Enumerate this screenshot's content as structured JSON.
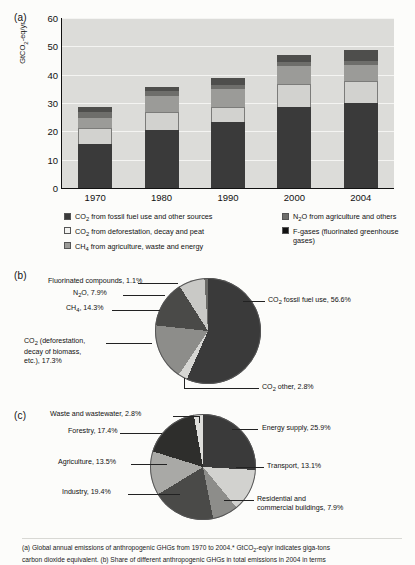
{
  "panels": {
    "a": {
      "letter": "(a)",
      "ylabel_pre": "GtCO",
      "ylabel_sub": "2",
      "ylabel_post": "-eq/yr"
    },
    "b": {
      "letter": "(b)"
    },
    "c": {
      "letter": "(c)"
    }
  },
  "legend_a": [
    {
      "key": "fossil",
      "pre": "CO",
      "sub": "2",
      "post": " from fossil fuel use and other sources",
      "color": "#3a3a3a"
    },
    {
      "key": "defor",
      "pre": "CO",
      "sub": "2",
      "post": " from deforestation, decay and peat",
      "color": "#f2f2f0"
    },
    {
      "key": "ch4",
      "pre": "CH",
      "sub": "4",
      "post": " from agriculture, waste and energy",
      "color": "#9b9b98"
    },
    {
      "key": "n2o",
      "pre": "N",
      "sub": "2",
      "post": "O from agriculture and others",
      "color": "#6e6e6b"
    },
    {
      "key": "fgases",
      "pre": "F-gases (fluorinated greenhouse",
      "sub": "",
      "post": " gases)",
      "color": "#111111"
    }
  ],
  "legend_a_labels": {
    "fossil": "CO2 from fossil fuel use and other sources",
    "defor": "CO2 from deforestation, decay and peat",
    "ch4": "CH4 from agriculture, waste and energy",
    "n2o": "N2O from agriculture and others",
    "fgases_line1": "F-gases (fluorinated greenhouse",
    "fgases_line2": "gases)"
  },
  "chart_data": [
    {
      "id": "panel-a",
      "type": "bar",
      "stacked": true,
      "title": "",
      "xlabel": "",
      "ylabel": "GtCO2-eq/yr",
      "ylim": [
        0,
        60
      ],
      "yticks": [
        0,
        10,
        20,
        30,
        40,
        50,
        60
      ],
      "grid": true,
      "categories": [
        "1970",
        "1980",
        "1990",
        "2000",
        "2004"
      ],
      "series": [
        {
          "name": "CO2 from fossil fuel use and other sources",
          "color": "#3a3a3a",
          "values": [
            15.5,
            20.3,
            23.3,
            28.5,
            30.0
          ]
        },
        {
          "name": "CO2 from deforestation, decay and peat",
          "color": "#d2d2cf",
          "values": [
            5.8,
            6.4,
            5.4,
            8.2,
            7.6
          ]
        },
        {
          "name": "CH4 from agriculture, waste and energy",
          "color": "#9b9b98",
          "values": [
            3.4,
            5.7,
            6.2,
            6.2,
            5.7
          ]
        },
        {
          "name": "N2O from agriculture and others",
          "color": "#6e6e6b",
          "values": [
            2.1,
            1.7,
            1.3,
            1.5,
            1.7
          ]
        },
        {
          "name": "F-gases (fluorinated greenhouse gases)",
          "color": "#4e4e4c",
          "values": [
            1.7,
            1.6,
            2.8,
            2.6,
            3.8
          ]
        }
      ],
      "totals": [
        28.7,
        35.6,
        39.4,
        49.0,
        49.0
      ]
    },
    {
      "id": "panel-b",
      "type": "pie",
      "title": "",
      "labels": [
        "CO2 fossil fuel use",
        "CO2 other",
        "CO2 (deforestation, decay of biomass, etc.)",
        "CH4",
        "N2O",
        "Fluorinated compounds"
      ],
      "values": [
        56.6,
        2.8,
        17.3,
        14.3,
        7.9,
        1.1
      ],
      "colors": [
        "#3a3a3a",
        "#d7d7d4",
        "#8d8d8a",
        "#4a4a48",
        "#c9c9c6",
        "#6b6b68"
      ]
    },
    {
      "id": "panel-c",
      "type": "pie",
      "title": "",
      "labels": [
        "Energy supply",
        "Transport",
        "Residential and commercial buildings",
        "Industry",
        "Agriculture",
        "Forestry",
        "Waste and wastewater"
      ],
      "values": [
        25.9,
        13.1,
        7.9,
        19.4,
        13.5,
        17.4,
        2.8
      ],
      "colors": [
        "#3a3a3a",
        "#d2d2cf",
        "#8d8d8a",
        "#4a4a48",
        "#a9a9a6",
        "#2e2e2c",
        "#dededb"
      ]
    }
  ],
  "xticks_a": [
    "1970",
    "1980",
    "1990",
    "2000",
    "2004"
  ],
  "yticks_a": [
    "60",
    "50",
    "40",
    "30",
    "20",
    "10",
    "0"
  ],
  "labels_b": {
    "fluorinated": "Fluorinated compounds, 1.1%",
    "n2o_pre": "N",
    "n2o_sub": "2",
    "n2o_post": "O, 7.9%",
    "ch4_pre": "CH",
    "ch4_sub": "4",
    "ch4_post": ", 14.3%",
    "co2_def_l1_pre": "CO",
    "co2_def_l1_sub": "2",
    "co2_def_l1_post": " (deforestation,",
    "co2_def_l2": "decay of biomass,",
    "co2_def_l3": "etc.), 17.3%",
    "co2_fossil_pre": "CO",
    "co2_fossil_sub": "2",
    "co2_fossil_post": " fossil fuel use, 56.6%",
    "co2_other_pre": "CO",
    "co2_other_sub": "2",
    "co2_other_post": " other, 2.8%"
  },
  "labels_c": {
    "waste": "Waste and wastewater, 2.8%",
    "forestry": "Forestry, 17.4%",
    "agriculture": "Agriculture, 13.5%",
    "industry": "Industry, 19.4%",
    "energy": "Energy supply, 25.9%",
    "transport": "Transport, 13.1%",
    "residential_l1": "Residential and",
    "residential_l2": "commercial buildings, 7.9%"
  },
  "caption": {
    "l1_a": "(a) Global annual emissions of anthropogenic GHGs from 1970 to 2004.",
    "l1_b": "*  GtCO",
    "l1_sub": "2",
    "l1_c": "-eq/yr indicates giga-tons",
    "l2": "carbon dioxide equivalent. (b) Share of different anthropogenic GHGs in total emissions in 2004 in terms"
  }
}
